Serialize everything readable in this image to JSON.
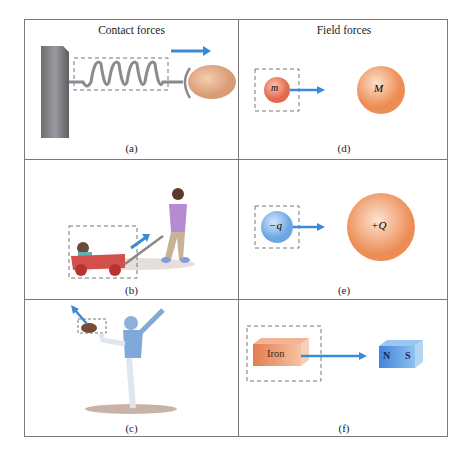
{
  "headers": {
    "left": "Contact forces",
    "right": "Field forces"
  },
  "panels": [
    {
      "id": "a",
      "caption": "(a)",
      "description": "Hand pulling a spring attached to a wall"
    },
    {
      "id": "b",
      "caption": "(b)",
      "description": "Child pulling a wagon with a toddler"
    },
    {
      "id": "c",
      "caption": "(c)",
      "description": "Football player kicking a football"
    },
    {
      "id": "d",
      "caption": "(d)",
      "small_mass_label": "m",
      "large_mass_label": "M"
    },
    {
      "id": "e",
      "caption": "(e)",
      "small_charge_label": "−q",
      "large_charge_label": "+Q"
    },
    {
      "id": "f",
      "caption": "(f)",
      "iron_label": "Iron",
      "magnet_north": "N",
      "magnet_south": "S"
    }
  ],
  "colors": {
    "arrow": "#3a8ad6",
    "orange_sphere": "#ef9a66",
    "blue_sphere": "#7fb3ea",
    "grid_line": "#7a7a7a"
  }
}
